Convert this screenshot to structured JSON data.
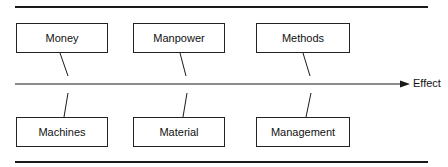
{
  "diagram": {
    "type": "cause-and-effect",
    "effect_label": "Effect",
    "top_causes": [
      {
        "label": "Money"
      },
      {
        "label": "Manpower"
      },
      {
        "label": "Methods"
      }
    ],
    "bottom_causes": [
      {
        "label": "Machines"
      },
      {
        "label": "Material"
      },
      {
        "label": "Management"
      }
    ],
    "colors": {
      "line": "#1a1a1a",
      "box_border": "#222222",
      "background": "#ffffff"
    }
  }
}
